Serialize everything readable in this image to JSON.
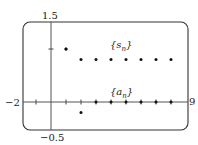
{
  "chart_data": {
    "type": "scatter",
    "title": "",
    "xlabel": "",
    "ylabel": "",
    "xlim": [
      -2,
      9
    ],
    "ylim": [
      -0.5,
      1.5
    ],
    "x_ticks": [
      -1,
      0,
      1,
      2,
      3,
      4,
      5,
      6,
      7,
      8
    ],
    "y_ticks": [
      1
    ],
    "grid": false,
    "axis_labels": {
      "xmin": "−2",
      "xmax": "9",
      "ymax": "1.5",
      "ymin": "−0.5"
    },
    "series": [
      {
        "name": "{s_n}",
        "label_text": "{s",
        "label_sub": "n",
        "x": [
          1,
          2,
          3,
          4,
          5,
          6,
          7,
          8
        ],
        "values": [
          1,
          0.8,
          0.8,
          0.8,
          0.8,
          0.8,
          0.8,
          0.8
        ]
      },
      {
        "name": "{a_n}",
        "label_text": "{a",
        "label_sub": "n",
        "x": [
          1,
          2,
          3,
          4,
          5,
          6,
          7,
          8
        ],
        "values": [
          1,
          -0.2,
          0,
          0,
          0,
          0,
          0,
          0
        ]
      }
    ]
  }
}
